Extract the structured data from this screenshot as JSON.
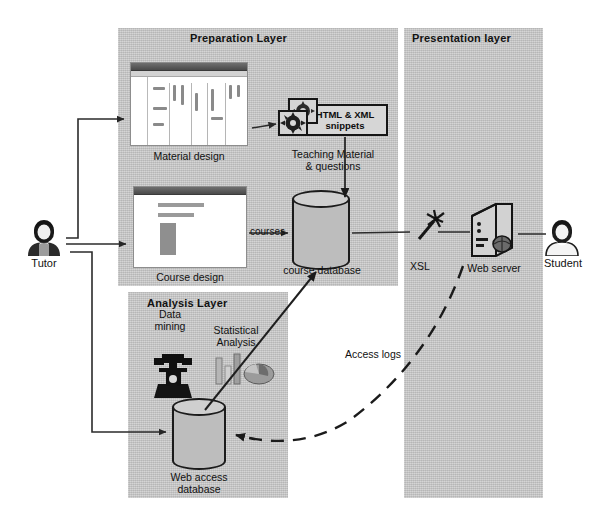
{
  "diagram": {
    "panels": [
      {
        "id": "preparation",
        "label": "Preparation Layer"
      },
      {
        "id": "presentation",
        "label": "Presentation layer"
      },
      {
        "id": "analysis",
        "label": "Analysis Layer"
      }
    ],
    "actors": [
      {
        "id": "tutor",
        "label": "Tutor"
      },
      {
        "id": "student",
        "label": "Student"
      }
    ],
    "nodes": [
      {
        "id": "material-design",
        "label": "Material design"
      },
      {
        "id": "course-design",
        "label": "Course design"
      },
      {
        "id": "snippets",
        "label_line1": "HTML & XML",
        "label_line2": "snippets"
      },
      {
        "id": "teaching-material",
        "label_line1": "Teaching Material",
        "label_line2": "& questions"
      },
      {
        "id": "course-database",
        "label": "course database"
      },
      {
        "id": "web-access-database",
        "label_line1": "Web access",
        "label_line2": "database"
      },
      {
        "id": "data-mining",
        "label_line1": "Data",
        "label_line2": "mining"
      },
      {
        "id": "statistical-analysis",
        "label_line1": "Statistical",
        "label_line2": "Analysis"
      },
      {
        "id": "xsl",
        "label": "XSL"
      },
      {
        "id": "web-server",
        "label": "Web server"
      }
    ],
    "edges": [
      {
        "id": "courses",
        "label": "courses"
      },
      {
        "id": "access-logs",
        "label": "Access logs"
      }
    ],
    "colors": {
      "panel": "#c7c7c7",
      "stroke": "#1b1b1b",
      "cylinder_fill": "#bdbdbd",
      "text": "#111111",
      "background": "#ffffff"
    }
  }
}
